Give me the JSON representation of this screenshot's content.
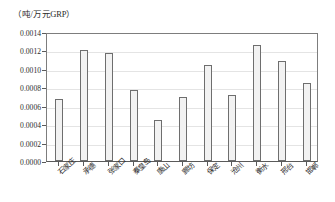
{
  "chart_data": {
    "type": "bar",
    "title": "",
    "subtitle": "",
    "xlabel": "",
    "ylabel": "（吨/万元GRP）",
    "unit_label": "（吨/万元GRP）",
    "categories": [
      "石家庄",
      "承德",
      "张家口",
      "秦皇岛",
      "唐山",
      "廊坊",
      "保定",
      "沧州",
      "衡水",
      "邢台",
      "邯郸"
    ],
    "values": [
      0.00067,
      0.00121,
      0.00117,
      0.00077,
      0.00044,
      0.0007,
      0.00104,
      0.00072,
      0.00126,
      0.00109,
      0.00085
    ],
    "ylim": [
      0.0,
      0.0014
    ],
    "ytick_values": [
      0.0,
      0.0002,
      0.0004,
      0.0006,
      0.0008,
      0.001,
      0.0012,
      0.0014
    ],
    "ytick_labels": [
      "0.0000",
      "0.0002",
      "0.0004",
      "0.0006",
      "0.0008",
      "0.0010",
      "0.0012",
      "0.0014"
    ],
    "grid": true,
    "legend": false,
    "legend_position": "none",
    "bar_fill_color": "#f2f2f2",
    "bar_border_color": "#6e6e6e",
    "axis_color": "#5a5a5a",
    "grid_color": "#e4e4e4",
    "text_color": "#2b2b2b"
  }
}
